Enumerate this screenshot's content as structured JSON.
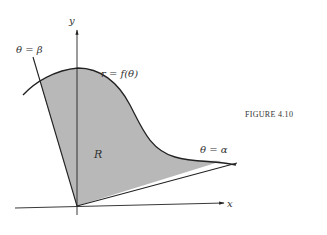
{
  "figure": {
    "caption": "FIGURE 4.10",
    "labels": {
      "y_axis": "y",
      "x_axis": "x",
      "curve": "r = f(θ)",
      "ray_beta": "θ = β",
      "ray_alpha": "θ = α",
      "region": "R"
    },
    "colors": {
      "region_fill": "#b8b8b8",
      "stroke": "#222222",
      "text": "#333333",
      "background": "#ffffff"
    }
  }
}
